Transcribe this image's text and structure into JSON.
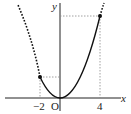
{
  "diagram": {
    "type": "function-graph",
    "function": "y = a x^2",
    "axis_labels": {
      "x": "x",
      "y": "y",
      "origin": "O"
    },
    "tick_labels": [
      {
        "value": -2,
        "text": "−2"
      },
      {
        "value": 4,
        "text": "4"
      }
    ],
    "highlighted_points": [
      {
        "x": -2,
        "y_rel": 4
      },
      {
        "x": 4,
        "y_rel": 16
      }
    ],
    "solid_domain": [
      -2,
      4
    ],
    "colors": {
      "curve": "#111111",
      "guide": "#888888",
      "axis": "#222222"
    }
  }
}
